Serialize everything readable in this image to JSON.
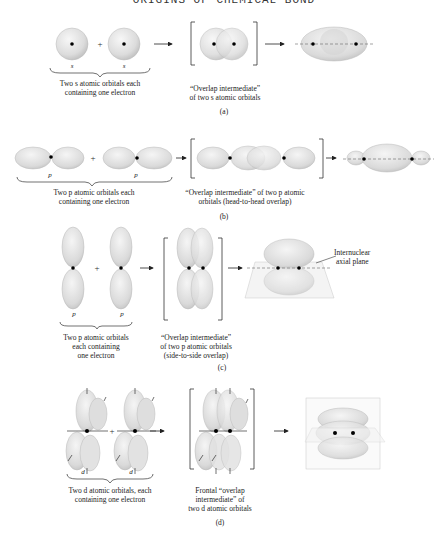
{
  "header": {
    "text": "ORIGINS OF CHEMICAL BOND"
  },
  "colors": {
    "orbital_fill": "#e4e4e4",
    "orbital_shade": "#c9c9c9",
    "nucleus": "#000000",
    "text": "#222222"
  },
  "panels": [
    {
      "id": "a",
      "caption": "(a)",
      "orbital_labels": [
        "s",
        "s"
      ],
      "operator": "+",
      "left_label": [
        "Two s atomic orbitals each",
        "containing one electron"
      ],
      "middle_label": [
        "“Overlap intermediate”",
        "of two s atomic orbitals"
      ]
    },
    {
      "id": "b",
      "caption": "(b)",
      "orbital_labels": [
        "p",
        "p"
      ],
      "operator": "+",
      "left_label": [
        "Two p atomic orbitals each",
        "containing one electron"
      ],
      "middle_label": [
        "“Overlap intermediate” of two p atomic",
        "orbitals (head-to-head overlap)"
      ]
    },
    {
      "id": "c",
      "caption": "(c)",
      "orbital_labels": [
        "p",
        "p"
      ],
      "operator": "+",
      "left_label": [
        "Two p atomic orbitals",
        "each containing",
        "one electron"
      ],
      "middle_label": [
        "“Overlap intermediate”",
        "of two p atomic orbitals",
        "(side-to-side overlap)"
      ],
      "annotation": [
        "Internuclear",
        "axial plane"
      ]
    },
    {
      "id": "d",
      "caption": "(d)",
      "orbital_labels": [
        "d",
        "d"
      ],
      "operator": "+",
      "left_label": [
        "Two d atomic orbitals, each",
        "containing one electron"
      ],
      "middle_label": [
        "Frontal “overlap",
        "intermediate” of",
        "two d atomic orbitals"
      ]
    }
  ]
}
